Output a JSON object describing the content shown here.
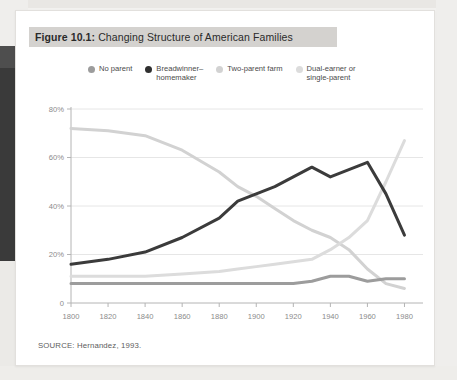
{
  "figure": {
    "label": "Figure 10.1:",
    "title": "Changing Structure of American Families",
    "source": "SOURCE: Hernandez, 1993."
  },
  "colors": {
    "no_parent": "#9c9c9c",
    "breadwinner": "#3b3b3b",
    "two_parent_farm": "#d2d2d2",
    "dual_earner": "#dcdcdc",
    "title_bar": "#d4d2cf",
    "grid": "#e6e6e6",
    "axis": "#b4b4b4",
    "card": "#ffffff"
  },
  "legend": [
    {
      "label": "No parent",
      "color": "#9c9c9c"
    },
    {
      "label": "Breadwinner–\nhomemaker",
      "color": "#2f2f2f"
    },
    {
      "label": "Two-parent farm",
      "color": "#d2d2d2"
    },
    {
      "label": "Dual-earner or\nsingle-parent",
      "color": "#dcdcdc"
    }
  ],
  "chart_data": {
    "type": "line",
    "title": "Changing Structure of American Families",
    "xlabel": "",
    "ylabel": "",
    "xlim": [
      1800,
      1990
    ],
    "ylim": [
      0,
      80
    ],
    "grid": true,
    "legend_position": "top",
    "ytick_labels": [
      "0",
      "20%",
      "40%",
      "60%",
      "80%"
    ],
    "ytick_values": [
      0,
      20,
      40,
      60,
      80
    ],
    "xtick_labels": [
      "1800",
      "1820",
      "1840",
      "1860",
      "1880",
      "1900",
      "1920",
      "1940",
      "1960",
      "1980"
    ],
    "xtick_values": [
      1800,
      1820,
      1840,
      1860,
      1880,
      1900,
      1920,
      1940,
      1960,
      1980
    ],
    "x": [
      1800,
      1820,
      1840,
      1860,
      1880,
      1890,
      1900,
      1910,
      1920,
      1930,
      1940,
      1950,
      1960,
      1970,
      1980
    ],
    "series": [
      {
        "name": "Two-parent farm",
        "color": "#d2d2d2",
        "values": [
          72,
          71,
          69,
          63,
          54,
          48,
          44,
          39,
          34,
          30,
          27,
          22,
          14,
          8,
          6
        ]
      },
      {
        "name": "Breadwinner–homemaker",
        "color": "#3b3b3b",
        "values": [
          16,
          18,
          21,
          27,
          35,
          42,
          45,
          48,
          52,
          56,
          52,
          55,
          58,
          45,
          28
        ]
      },
      {
        "name": "Dual-earner or single-parent",
        "color": "#dcdcdc",
        "values": [
          11,
          11,
          11,
          12,
          13,
          14,
          15,
          16,
          17,
          18,
          22,
          27,
          34,
          50,
          67
        ]
      },
      {
        "name": "No parent",
        "color": "#9c9c9c",
        "values": [
          8,
          8,
          8,
          8,
          8,
          8,
          8,
          8,
          8,
          9,
          11,
          11,
          9,
          10,
          10
        ]
      }
    ]
  }
}
